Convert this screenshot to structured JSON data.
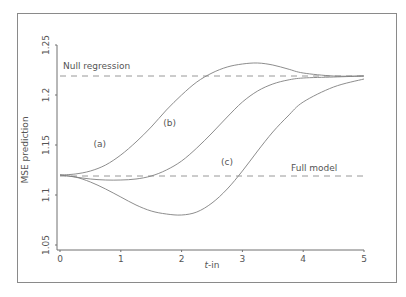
{
  "chart_data": {
    "type": "line",
    "title": "",
    "xlabel": "t-in",
    "xlabel_italic_part": "t",
    "xlabel_rest": "-in",
    "ylabel": "MSE prediction",
    "xlim": [
      0,
      5
    ],
    "ylim": [
      1.05,
      1.25
    ],
    "xticks": [
      "0",
      "1",
      "2",
      "3",
      "4",
      "5"
    ],
    "yticks": [
      "1.05",
      "1.1",
      "1.15",
      "1.2",
      "1.25"
    ],
    "grid": false,
    "legend": "none (inline curve labels)",
    "reference_lines": [
      {
        "name": "Null regression",
        "y": 1.219,
        "style": "dashed"
      },
      {
        "name": "Full model",
        "y": 1.119,
        "style": "dashed"
      }
    ],
    "series": [
      {
        "name": "(a)",
        "x": [
          0,
          0.25,
          0.5,
          0.75,
          1,
          1.25,
          1.5,
          1.75,
          2,
          2.25,
          2.5,
          2.75,
          3,
          3.25,
          3.5,
          3.75,
          4,
          4.5,
          5
        ],
        "y": [
          1.12,
          1.121,
          1.124,
          1.13,
          1.14,
          1.153,
          1.168,
          1.185,
          1.2,
          1.213,
          1.222,
          1.228,
          1.231,
          1.232,
          1.23,
          1.226,
          1.222,
          1.219,
          1.219
        ]
      },
      {
        "name": "(b)",
        "x": [
          0,
          0.25,
          0.5,
          0.75,
          1,
          1.25,
          1.5,
          1.75,
          2,
          2.25,
          2.5,
          2.75,
          3,
          3.25,
          3.5,
          3.75,
          4,
          4.5,
          5
        ],
        "y": [
          1.12,
          1.118,
          1.116,
          1.115,
          1.115,
          1.116,
          1.119,
          1.125,
          1.134,
          1.147,
          1.162,
          1.178,
          1.193,
          1.204,
          1.211,
          1.215,
          1.217,
          1.218,
          1.219
        ]
      },
      {
        "name": "(c)",
        "x": [
          0,
          0.25,
          0.5,
          0.75,
          1,
          1.25,
          1.5,
          1.75,
          2,
          2.25,
          2.5,
          2.75,
          3,
          3.25,
          3.5,
          3.75,
          4,
          4.5,
          5
        ],
        "y": [
          1.12,
          1.118,
          1.113,
          1.106,
          1.098,
          1.09,
          1.084,
          1.081,
          1.08,
          1.083,
          1.092,
          1.106,
          1.124,
          1.144,
          1.163,
          1.179,
          1.193,
          1.208,
          1.216
        ]
      }
    ],
    "annotations": [
      {
        "text": "Null regression",
        "x": 0.05,
        "y": 1.226
      },
      {
        "text": "Full model",
        "x": 3.8,
        "y": 1.124
      },
      {
        "text": "(a)",
        "x": 0.55,
        "y": 1.148
      },
      {
        "text": "(b)",
        "x": 1.7,
        "y": 1.169
      },
      {
        "text": "(c)",
        "x": 2.65,
        "y": 1.13
      }
    ]
  },
  "colors": {
    "curve": "#808080",
    "axis": "#707070",
    "dash": "#8c8c8c",
    "text": "#555555",
    "frame": "#8a8a8a"
  }
}
